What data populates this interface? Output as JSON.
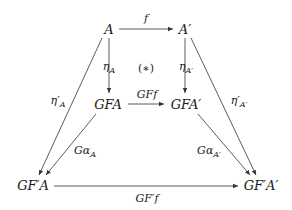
{
  "diagram": {
    "type": "commutative-diagram",
    "nodes": {
      "A": {
        "label": "A",
        "x": 109,
        "y": 29
      },
      "A_prime": {
        "label": "A′",
        "x": 185,
        "y": 29
      },
      "GFA": {
        "label": "GFA",
        "x": 108,
        "y": 104
      },
      "GFA_prime": {
        "label": "GFA′",
        "x": 186,
        "y": 104
      },
      "GFpA": {
        "label": "GF′A",
        "x": 33,
        "y": 185
      },
      "GFpA_prime": {
        "label": "GF′A′",
        "x": 261,
        "y": 185
      }
    },
    "edges": {
      "f": {
        "main": "f",
        "sub": "",
        "from": "A",
        "to": "A_prime"
      },
      "eta_A": {
        "main": "η",
        "sub": "A",
        "from": "A",
        "to": "GFA"
      },
      "eta_A_prime": {
        "main": "η",
        "sub": "A′",
        "from": "A_prime",
        "to": "GFA_prime"
      },
      "GFf": {
        "main": "GFf",
        "sub": "",
        "from": "GFA",
        "to": "GFA_prime"
      },
      "eta_prime_A": {
        "main": "η′",
        "sub": "A",
        "from": "A",
        "to": "GFpA"
      },
      "eta_prime_A_prime": {
        "main": "η′",
        "sub": "A′",
        "from": "A_prime",
        "to": "GFpA_prime"
      },
      "G_alpha_A": {
        "main": "Gα",
        "sub": "A",
        "from": "GFA",
        "to": "GFpA"
      },
      "G_alpha_A_prime": {
        "main": "Gα",
        "sub": "A′",
        "from": "GFA_prime",
        "to": "GFpA_prime"
      },
      "GFpf": {
        "main": "GF′f",
        "sub": "",
        "from": "GFpA",
        "to": "GFpA_prime"
      }
    },
    "annotation": "(∗)",
    "line_color": "#333333"
  }
}
